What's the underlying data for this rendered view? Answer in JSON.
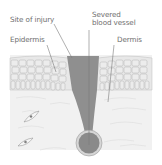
{
  "diagram": {
    "labels": {
      "site_of_injury": "Site of injury",
      "epidermis": "Epidermis",
      "severed_blood_vessel_line1": "Severed",
      "severed_blood_vessel_line2": "blood vessel",
      "dermis": "Dermis"
    },
    "colors": {
      "background": "#ffffff",
      "dermis_fill": "#f1f1f1",
      "epidermis_fill": "#e6e6e6",
      "cell_outline": "#b4b4b4",
      "wound_fill": "#8f8f8f",
      "vessel_fill": "#8a8a8a",
      "vessel_ring": "#d6d6d6",
      "leader_line": "#7a7a7a",
      "label_text": "#6e6e6e"
    }
  }
}
